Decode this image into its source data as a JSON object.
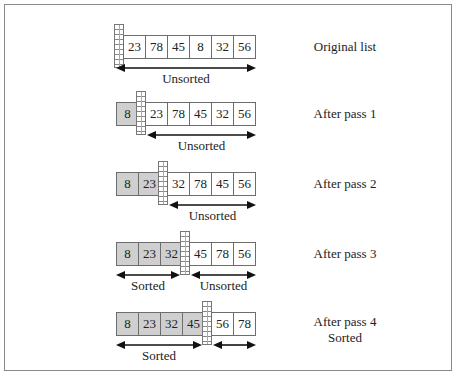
{
  "diagram": {
    "colors": {
      "sorted_fill": "#cfcfcf",
      "unsorted_fill": "#ffffff",
      "border": "#6d6d6d",
      "frame": "#8a8a8a"
    },
    "rows": [
      {
        "label": "Original list",
        "values": [
          "23",
          "78",
          "45",
          "8",
          "32",
          "56"
        ],
        "sorted_count": 0,
        "sorted_label": "",
        "unsorted_label": "Unsorted"
      },
      {
        "label": "After pass 1",
        "values": [
          "8",
          "23",
          "78",
          "45",
          "32",
          "56"
        ],
        "sorted_count": 1,
        "sorted_label": "",
        "unsorted_label": "Unsorted"
      },
      {
        "label": "After pass 2",
        "values": [
          "8",
          "23",
          "32",
          "78",
          "45",
          "56"
        ],
        "sorted_count": 2,
        "sorted_label": "",
        "unsorted_label": "Unsorted"
      },
      {
        "label": "After pass 3",
        "values": [
          "8",
          "23",
          "32",
          "45",
          "78",
          "56"
        ],
        "sorted_count": 3,
        "sorted_label": "Sorted",
        "unsorted_label": "Unsorted"
      },
      {
        "label": "After pass 4",
        "label2": "Sorted",
        "values": [
          "8",
          "23",
          "32",
          "45",
          "56",
          "78"
        ],
        "sorted_count": 4,
        "sorted_label": "Sorted",
        "unsorted_label": ""
      }
    ]
  }
}
